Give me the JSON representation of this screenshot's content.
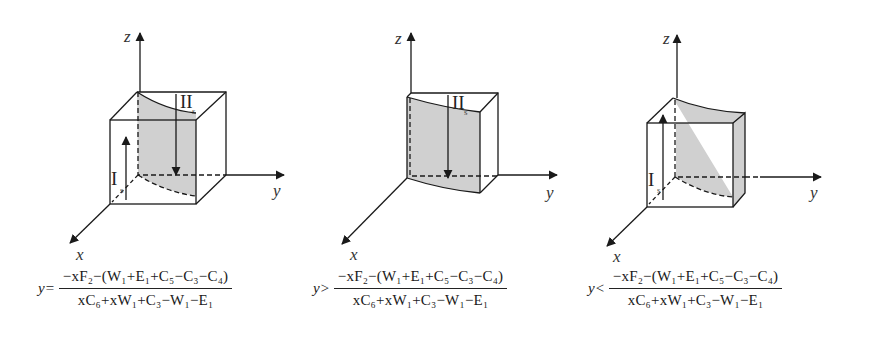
{
  "figure": {
    "panels": [
      {
        "id": "panel-1",
        "axes": {
          "z": "z",
          "y": "y",
          "x": "x"
        },
        "arrows": [
          {
            "label": "I",
            "subscript": "s",
            "direction": "up"
          },
          {
            "label": "II",
            "subscript": "s",
            "direction": "down"
          }
        ],
        "formula": {
          "lhs": "y=",
          "numerator": "−xF₂−(W₁+E₁+C₅−C₃−C₄)",
          "denominator": "xC₆+xW₁+C₃−W₁−E₁"
        }
      },
      {
        "id": "panel-2",
        "axes": {
          "z": "z",
          "y": "y",
          "x": "x"
        },
        "arrows": [
          {
            "label": "II",
            "subscript": "s",
            "direction": "down"
          }
        ],
        "formula": {
          "lhs": "y>",
          "numerator": "−xF₂−(W₁+E₁+C₅−C₃−C₄)",
          "denominator": "xC₆+xW₁+C₃−W₁−E₁"
        }
      },
      {
        "id": "panel-3",
        "axes": {
          "z": "z",
          "y": "y",
          "x": "x"
        },
        "arrows": [
          {
            "label": "I",
            "subscript": "s",
            "direction": "up"
          }
        ],
        "formula": {
          "lhs": "y<",
          "numerator": "−xF₂−(W₁+E₁+C₅−C₃−C₄)",
          "denominator": "xC₆+xW₁+C₃−W₁−E₁"
        }
      }
    ],
    "colors": {
      "stroke": "#1a1a1a",
      "shade": "#d0d0d0",
      "background": "#ffffff"
    }
  }
}
